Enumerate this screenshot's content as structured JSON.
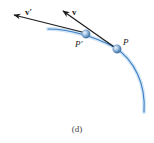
{
  "figure": {
    "caption": "(d)",
    "colors": {
      "path": "#3b7fc4",
      "path_glow": "#a9cdee",
      "vector": "#1a1a1a",
      "particle": "#6f9fcc",
      "particle_highlight": "#e8f2fb"
    },
    "vectors": [
      {
        "name": "v-prime",
        "label": "v′",
        "from_point": "P′"
      },
      {
        "name": "v",
        "label": "v",
        "from_point": "P"
      }
    ],
    "points": [
      {
        "name": "P-prime",
        "label": "P′"
      },
      {
        "name": "P",
        "label": "P"
      }
    ],
    "labels": {
      "v_prime": "v′",
      "v": "v",
      "p_prime": "P′",
      "p": "P"
    }
  }
}
